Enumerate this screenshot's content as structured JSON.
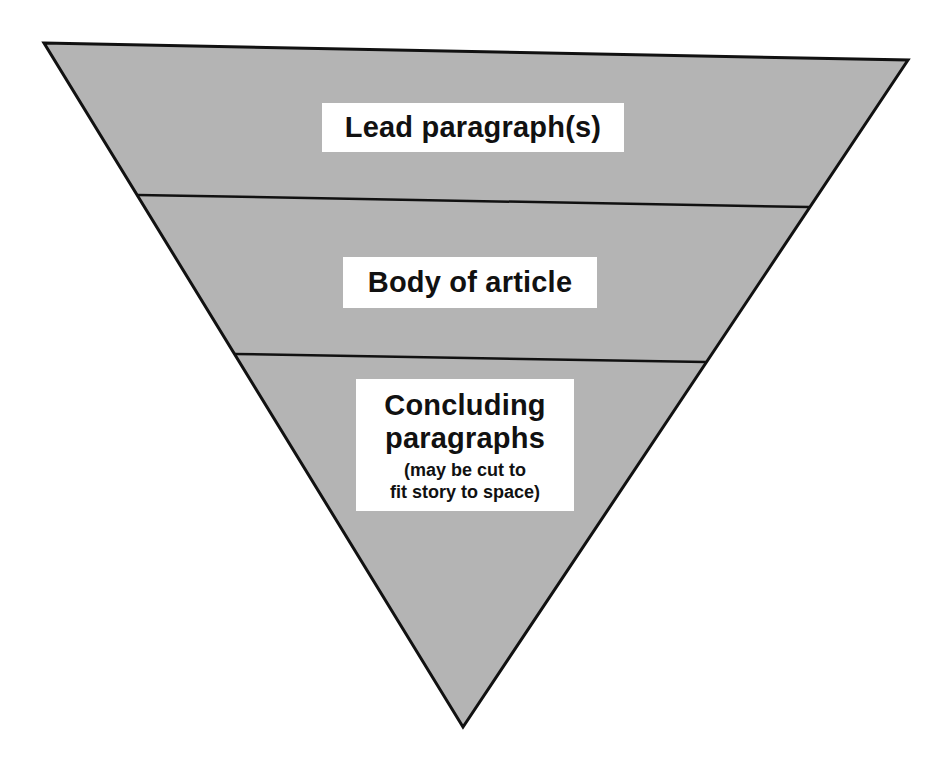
{
  "diagram": {
    "type": "inverted-pyramid",
    "colors": {
      "fill": "#b4b4b4",
      "outline": "#111111",
      "label_background": "#ffffff",
      "text": "#111111",
      "page_background": "#ffffff"
    },
    "geometry": {
      "top_left": [
        44,
        43
      ],
      "top_right": [
        908,
        60
      ],
      "bottom_tip": [
        463,
        727
      ],
      "divider_1": {
        "left": [
          138,
          195
        ],
        "right": [
          809,
          207
        ]
      },
      "divider_2": {
        "left": [
          234,
          354
        ],
        "right": [
          706,
          362
        ]
      }
    },
    "sections": [
      {
        "id": "lead",
        "title": "Lead paragraph(s)"
      },
      {
        "id": "body",
        "title": "Body of article"
      },
      {
        "id": "concluding",
        "title_line_1": "Concluding",
        "title_line_2": "paragraphs",
        "note_line_1": "(may be cut to",
        "note_line_2": "fit story to space)"
      }
    ]
  }
}
